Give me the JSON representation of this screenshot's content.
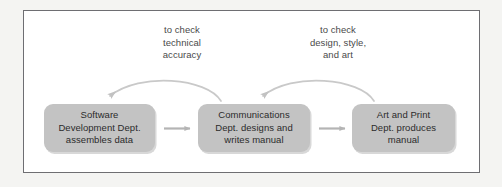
{
  "figure": {
    "type": "process-flow-diagram",
    "frame": {
      "border_color": "#6e6e72",
      "background": "#ffffff"
    },
    "page_background": "#f4f4f2"
  },
  "colors": {
    "box_fill": "#c3c3c3",
    "box_shadow": "#d8d8d8",
    "box_text": "#2b2b2b",
    "label_text": "#4a4a4a",
    "forward_arrow": "#b4b4b4",
    "feedback_arrow": "#c9c9c9"
  },
  "boxes": [
    {
      "id": "software-development",
      "text": "Software\nDevelopment Dept.\nassembles data",
      "lines": [
        "Software",
        "Development Dept.",
        "assembles data"
      ]
    },
    {
      "id": "communications",
      "text": "Communications\nDept. designs and\nwrites manual",
      "lines": [
        "Communications",
        "Dept. designs and",
        "writes manual"
      ]
    },
    {
      "id": "art-and-print",
      "text": "Art and Print\nDept. produces\nmanual",
      "lines": [
        "Art and Print",
        "Dept. produces",
        "manual"
      ]
    }
  ],
  "forward_arrows": [
    {
      "id": "arrow-software-to-communications",
      "from": "software-development",
      "to": "communications",
      "label": ""
    },
    {
      "id": "arrow-communications-to-art",
      "from": "communications",
      "to": "art-and-print",
      "label": ""
    }
  ],
  "feedback_arrows": [
    {
      "id": "feedback-communications-to-software",
      "from": "communications",
      "to": "software-development",
      "text": "to check\ntechnical\naccuracy",
      "lines": [
        "to check",
        "technical",
        "accuracy"
      ]
    },
    {
      "id": "feedback-art-to-communications",
      "from": "art-and-print",
      "to": "communications",
      "text": "to check\ndesign, style,\nand art",
      "lines": [
        "to check",
        "design, style,",
        "and art"
      ]
    }
  ]
}
